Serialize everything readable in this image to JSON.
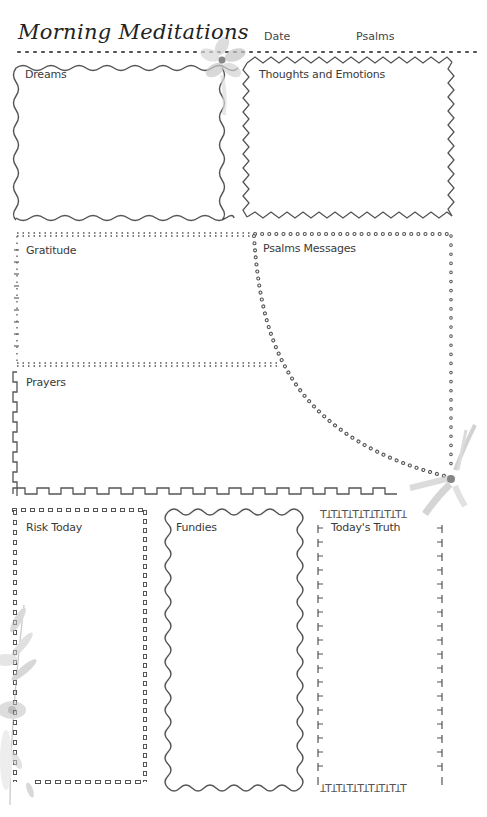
{
  "page": {
    "title": "Morning Meditations",
    "header_fields": {
      "date_label": "Date",
      "psalms_label": "Psalms"
    }
  },
  "sections": {
    "dreams": {
      "label": "Dreams",
      "border": "wavy"
    },
    "thoughts": {
      "label": "Thoughts and Emotions",
      "border": "zigzag"
    },
    "gratitude": {
      "label": "Gratitude",
      "border": "tick-marks"
    },
    "psalms_messages": {
      "label": "Psalms Messages",
      "border": "dotted-circles"
    },
    "prayers": {
      "label": "Prayers",
      "border": "square-wave"
    },
    "risk_today": {
      "label": "Risk Today",
      "border": "small-squares"
    },
    "fundies": {
      "label": "Fundies",
      "border": "scalloped"
    },
    "todays_truth": {
      "label": "Today's Truth",
      "border": "t-glyphs"
    }
  },
  "decorations": [
    "flower-top-center",
    "flower-right-middle",
    "flower-leaves-bottom-left"
  ],
  "colors": {
    "ink": "#4a4a4a",
    "flower": "#b5b5b5",
    "background": "#ffffff"
  }
}
